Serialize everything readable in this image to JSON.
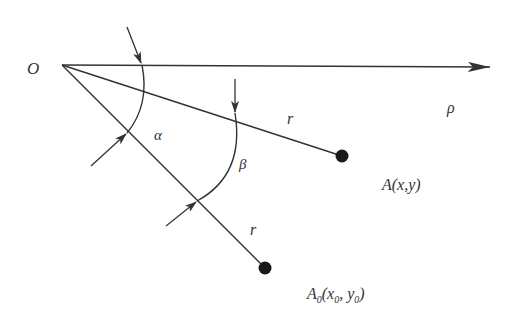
{
  "diagram": {
    "type": "geometry-rotation",
    "colors": {
      "stroke": "#333333",
      "background": "#ffffff",
      "point_fill": "#1a1a1a"
    },
    "labels": {
      "origin": "O",
      "axis": "ρ",
      "angle_alpha": "α",
      "angle_beta": "β",
      "radius_upper": "r",
      "radius_lower": "r",
      "point_A": "A(x,y)",
      "point_A0_main": "A",
      "point_A0_sub": "0",
      "point_A0_open": "(x",
      "point_A0_x_sub": "0",
      "point_A0_comma": ", y",
      "point_A0_y_sub": "0",
      "point_A0_close": ")"
    },
    "points": {
      "O": [
        62,
        65
      ],
      "A": [
        342,
        156
      ],
      "A0": [
        265,
        268
      ]
    }
  }
}
